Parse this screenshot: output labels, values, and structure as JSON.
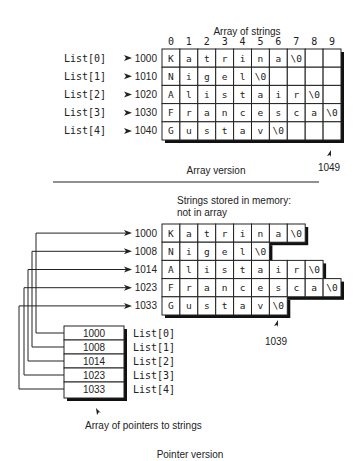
{
  "array_version": {
    "title": "Array of strings",
    "column_indices": [
      "0",
      "1",
      "2",
      "3",
      "4",
      "5",
      "6",
      "7",
      "8",
      "9"
    ],
    "rows": [
      {
        "label": "List[0]",
        "address": "1000",
        "cells": [
          "K",
          "a",
          "t",
          "r",
          "i",
          "n",
          "a",
          "\\0",
          "",
          ""
        ]
      },
      {
        "label": "List[1]",
        "address": "1010",
        "cells": [
          "N",
          "i",
          "g",
          "e",
          "l",
          "\\0",
          "",
          "",
          "",
          ""
        ]
      },
      {
        "label": "List[2]",
        "address": "1020",
        "cells": [
          "A",
          "l",
          "i",
          "s",
          "t",
          "a",
          "i",
          "r",
          "\\0",
          ""
        ]
      },
      {
        "label": "List[3]",
        "address": "1030",
        "cells": [
          "F",
          "r",
          "a",
          "n",
          "c",
          "e",
          "s",
          "c",
          "a",
          "\\0"
        ]
      },
      {
        "label": "List[4]",
        "address": "1040",
        "cells": [
          "G",
          "u",
          "s",
          "t",
          "a",
          "v",
          "\\0",
          "",
          "",
          ""
        ]
      }
    ],
    "end_address": "1049",
    "caption": "Array version"
  },
  "pointer_version": {
    "memory_note_line1": "Strings stored in memory:",
    "memory_note_line2": "not in array",
    "strings": [
      {
        "address": "1000",
        "cells": [
          "K",
          "a",
          "t",
          "r",
          "i",
          "n",
          "a",
          "\\0"
        ]
      },
      {
        "address": "1008",
        "cells": [
          "N",
          "i",
          "g",
          "e",
          "l",
          "\\0"
        ]
      },
      {
        "address": "1014",
        "cells": [
          "A",
          "l",
          "i",
          "s",
          "t",
          "a",
          "i",
          "r",
          "\\0"
        ]
      },
      {
        "address": "1023",
        "cells": [
          "F",
          "r",
          "a",
          "n",
          "c",
          "e",
          "s",
          "c",
          "a",
          "\\0"
        ]
      },
      {
        "address": "1033",
        "cells": [
          "G",
          "u",
          "s",
          "t",
          "a",
          "v",
          "\\0"
        ]
      }
    ],
    "end_address": "1039",
    "pointer_array": [
      {
        "value": "1000",
        "label": "List[0]"
      },
      {
        "value": "1008",
        "label": "List[1]"
      },
      {
        "value": "1014",
        "label": "List[2]"
      },
      {
        "value": "1023",
        "label": "List[3]"
      },
      {
        "value": "1033",
        "label": "List[4]"
      }
    ],
    "pointer_array_caption": "Array of pointers to strings",
    "caption": "Pointer version"
  }
}
